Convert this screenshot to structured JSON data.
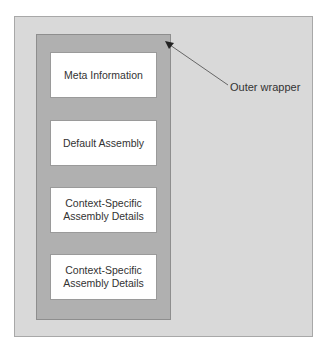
{
  "diagram": {
    "outer_label": "Outer wrapper",
    "boxes": [
      {
        "label": "Meta Information"
      },
      {
        "label": "Default Assembly"
      },
      {
        "label": "Context-Specific\nAssembly Details"
      },
      {
        "label": "Context-Specific\nAssembly Details"
      }
    ]
  },
  "colors": {
    "outer_fill": "#d9d9d9",
    "inner_fill": "#b0b0b0",
    "box_fill": "#ffffff"
  }
}
